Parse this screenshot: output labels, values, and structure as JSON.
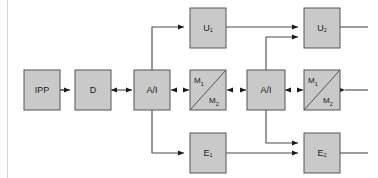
{
  "figure": {
    "type": "block-diagram",
    "title": "",
    "background_color": "#ffffff",
    "box_fill_color": "#c9c9c9",
    "box_stroke_color": "#555555",
    "wire_color": "#4a4a4a",
    "margin_rule_color": "#d0d0d0"
  },
  "nodes": {
    "ipp": {
      "label": "IPP",
      "sub": ""
    },
    "d": {
      "label": "D",
      "sub": ""
    },
    "ai1": {
      "label": "A/I",
      "sub": ""
    },
    "m1a": {
      "label": "M",
      "sub": "1"
    },
    "m2a": {
      "label": "M",
      "sub": "2"
    },
    "ai2": {
      "label": "A/I",
      "sub": ""
    },
    "m1b": {
      "label": "M",
      "sub": "1"
    },
    "m2b": {
      "label": "M",
      "sub": "2"
    },
    "u1": {
      "label": "U",
      "sub": "1"
    },
    "u2": {
      "label": "U",
      "sub": "2"
    },
    "e1": {
      "label": "E",
      "sub": "1"
    },
    "e2": {
      "label": "E",
      "sub": "2"
    }
  },
  "connections": [
    {
      "from": "ipp",
      "to": "d",
      "style": "single-arrow"
    },
    {
      "from": "d",
      "to": "ai1",
      "style": "double-arrow"
    },
    {
      "from": "ai1",
      "to": "m1a-m2a",
      "style": "double-arrow"
    },
    {
      "from": "m1a-m2a",
      "to": "ai2",
      "style": "double-arrow"
    },
    {
      "from": "ai2",
      "to": "m1b-m2b",
      "style": "double-arrow"
    },
    {
      "from": "external-right",
      "to": "m1b-m2b",
      "style": "single-arrow"
    },
    {
      "from": "ai1",
      "to": "u1",
      "style": "single-arrow"
    },
    {
      "from": "ai1",
      "to": "e1",
      "style": "single-arrow"
    },
    {
      "from": "u1",
      "to": "u2",
      "style": "single-arrow"
    },
    {
      "from": "e1",
      "to": "e2",
      "style": "single-arrow"
    },
    {
      "from": "ai2",
      "to": "u2",
      "style": "single-arrow"
    },
    {
      "from": "ai2",
      "to": "e2",
      "style": "single-arrow"
    },
    {
      "from": "u2",
      "to": "external-right",
      "style": "line"
    },
    {
      "from": "e2",
      "to": "external-right",
      "style": "line"
    }
  ]
}
